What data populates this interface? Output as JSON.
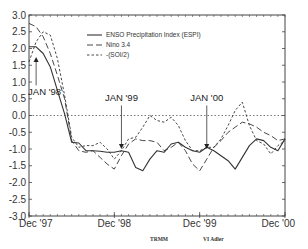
{
  "chart_data": {
    "type": "line",
    "title": "",
    "xlabel": "",
    "ylabel": "",
    "ylim": [
      -3.0,
      3.0
    ],
    "yticks": [
      "3.0",
      "2.5",
      "2.0",
      "1.5",
      "1.0",
      "0.5",
      "0.0",
      "-0.5",
      "-1.0",
      "-1.5",
      "-2.0",
      "-2.5",
      "-3.0"
    ],
    "ytick_values": [
      3.0,
      2.5,
      2.0,
      1.5,
      1.0,
      0.5,
      0.0,
      -0.5,
      -1.0,
      -1.5,
      -2.0,
      -2.5,
      -3.0
    ],
    "xlim_months": [
      0,
      36
    ],
    "xticks": [
      {
        "month": 0,
        "label": "Dec '97"
      },
      {
        "month": 12,
        "label": "Dec '98"
      },
      {
        "month": 24,
        "label": "Dec '99"
      },
      {
        "month": 36,
        "label": "Dec '00"
      }
    ],
    "zero_line": true,
    "legend_placement": "top-center",
    "series": [
      {
        "name": "ENSO Precipitation Index (ESPI)",
        "style": "solid",
        "values": [
          2.05,
          2.05,
          1.85,
          1.45,
          0.75,
          0.05,
          -0.8,
          -0.82,
          -1.05,
          -1.05,
          -1.07,
          -1.1,
          -1.1,
          -1.05,
          -1.1,
          -1.55,
          -1.65,
          -1.3,
          -1.05,
          -1.1,
          -0.85,
          -0.8,
          -0.95,
          -1.05,
          -1.1,
          -0.95,
          -1.05,
          -1.2,
          -1.35,
          -1.6,
          -1.25,
          -0.9,
          -0.7,
          -0.75,
          -0.95,
          -1.05,
          -0.7
        ]
      },
      {
        "name": "Nino 3.4",
        "style": "dashed",
        "values": [
          2.75,
          2.65,
          2.35,
          1.85,
          1.2,
          0.5,
          -0.75,
          -1.05,
          -1.1,
          -1.05,
          -1.25,
          -1.45,
          -1.6,
          -1.2,
          -0.85,
          -0.7,
          -0.75,
          -0.75,
          -0.8,
          -1.05,
          -0.95,
          -0.8,
          -1.05,
          -1.45,
          -1.65,
          -1.3,
          -0.95,
          -0.75,
          -0.5,
          -0.35,
          -0.2,
          -0.25,
          -0.35,
          -0.5,
          -0.6,
          -0.75,
          -0.7
        ]
      },
      {
        "name": "-(SOI/2)",
        "style": "dotted",
        "values": [
          1.6,
          2.2,
          2.5,
          2.4,
          1.7,
          0.6,
          -0.65,
          -0.95,
          -0.9,
          -0.9,
          -0.8,
          -1.0,
          -1.3,
          -1.05,
          -0.7,
          -0.65,
          -0.35,
          0.0,
          -0.15,
          -0.2,
          -0.05,
          -0.3,
          -0.75,
          -1.05,
          -1.05,
          -0.95,
          -0.95,
          -0.7,
          -0.3,
          0.15,
          0.4,
          -0.3,
          -0.75,
          -0.85,
          -1.15,
          -0.9,
          -0.75
        ]
      }
    ],
    "annotations": [
      {
        "label": "JAN '98",
        "month": 1,
        "direction": "up"
      },
      {
        "label": "JAN '99",
        "month": 13,
        "direction": "down"
      },
      {
        "label": "JAN '00",
        "month": 25,
        "direction": "down"
      }
    ]
  },
  "credits": {
    "left": "TRMM",
    "right": "VI Adler"
  }
}
